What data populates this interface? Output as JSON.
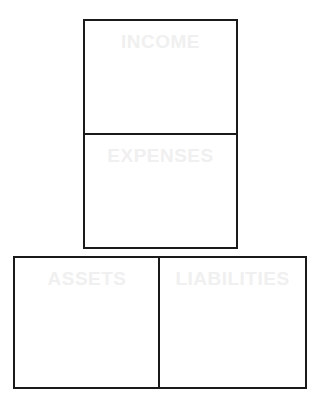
{
  "diagram": {
    "type": "accounting-categories-boxes",
    "boxes": [
      {
        "id": "income",
        "label": "INCOME"
      },
      {
        "id": "expenses",
        "label": "EXPENSES"
      },
      {
        "id": "assets",
        "label": "ASSETS"
      },
      {
        "id": "liabilities",
        "label": "LIABILITIES"
      }
    ],
    "colors": {
      "border": "#1a1a1a",
      "label_text": "#f0f0f0",
      "background": "#ffffff"
    }
  }
}
